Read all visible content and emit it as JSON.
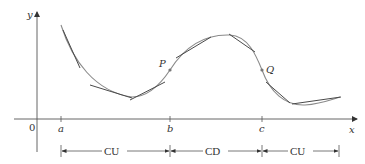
{
  "diagram": {
    "axes": {
      "x_label": "x",
      "y_label": "y",
      "origin_label": "0",
      "color": "#444444"
    },
    "ticks": [
      {
        "label": "a",
        "x": 61
      },
      {
        "label": "b",
        "x": 170
      },
      {
        "label": "c",
        "x": 262
      }
    ],
    "points": [
      {
        "label": "P",
        "description": "inflection point"
      },
      {
        "label": "Q",
        "description": "inflection point"
      }
    ],
    "intervals": [
      {
        "label": "CU",
        "from": "a",
        "to": "b"
      },
      {
        "label": "CD",
        "from": "b",
        "to": "c"
      },
      {
        "label": "CU",
        "from": "c",
        "to": "end"
      }
    ],
    "curve_color": "#888888",
    "tangent_color": "#555555"
  }
}
